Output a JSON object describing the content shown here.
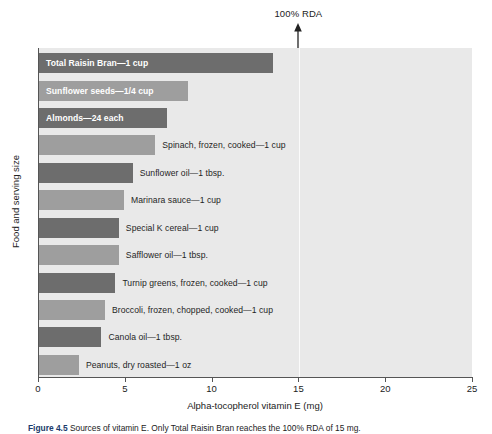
{
  "figure": {
    "annotation": {
      "rda_label": "100% RDA",
      "rda_value": 15,
      "arrow_icon": "up-arrow-icon"
    },
    "caption_number": "Figure 4.5",
    "caption_body": "Sources of vitamin E. Only Total Raisin Bran reaches the 100% RDA of 15 mg."
  },
  "chart_data": {
    "type": "bar",
    "orientation": "horizontal",
    "title": "",
    "xlabel": "Alpha-tocopherol vitamin E (mg)",
    "ylabel": "Food and serving size",
    "xlim": [
      0,
      25
    ],
    "xticks": [
      0,
      5,
      10,
      15,
      20,
      25
    ],
    "xtick_labels": [
      "0",
      "5",
      "10",
      "15",
      "20",
      "25"
    ],
    "grid": false,
    "legend": "none",
    "annotations": [
      {
        "label": "100% RDA",
        "x": 15,
        "type": "vline-with-arrow"
      }
    ],
    "colors": {
      "bar_dark": "#6d6d6d",
      "bar_light": "#9e9e9e",
      "plot_background": "#e9e9e9",
      "axis": "#555555",
      "label_inside": "#ffffff",
      "label_outside": "#1f1f1f",
      "caption_accent": "#1a3a6b"
    },
    "categories": [
      "Total Raisin Bran—1 cup",
      "Sunflower seeds—1/4 cup",
      "Almonds—24 each",
      "Spinach, frozen, cooked—1 cup",
      "Sunflower oil—1 tbsp.",
      "Marinara sauce—1 cup",
      "Special K cereal—1 cup",
      "Safflower oil—1 tbsp.",
      "Turnip greens, frozen, cooked—1 cup",
      "Broccoli, frozen, chopped, cooked—1 cup",
      "Canola oil—1 tbsp.",
      "Peanuts, dry roasted—1 oz"
    ],
    "values": [
      13.5,
      8.6,
      7.4,
      6.7,
      5.4,
      4.9,
      4.6,
      4.6,
      4.4,
      3.8,
      3.6,
      2.3
    ],
    "bars": [
      {
        "label": "Total Raisin Bran—1 cup",
        "value": 13.5,
        "shade": "dark",
        "label_position": "inside"
      },
      {
        "label": "Sunflower seeds—1/4 cup",
        "value": 8.6,
        "shade": "light",
        "label_position": "inside"
      },
      {
        "label": "Almonds—24 each",
        "value": 7.4,
        "shade": "dark",
        "label_position": "inside"
      },
      {
        "label": "Spinach, frozen, cooked—1 cup",
        "value": 6.7,
        "shade": "light",
        "label_position": "outside"
      },
      {
        "label": "Sunflower oil—1 tbsp.",
        "value": 5.4,
        "shade": "dark",
        "label_position": "outside"
      },
      {
        "label": "Marinara sauce—1 cup",
        "value": 4.9,
        "shade": "light",
        "label_position": "outside"
      },
      {
        "label": "Special K cereal—1 cup",
        "value": 4.6,
        "shade": "dark",
        "label_position": "outside"
      },
      {
        "label": "Safflower oil—1 tbsp.",
        "value": 4.6,
        "shade": "light",
        "label_position": "outside"
      },
      {
        "label": "Turnip greens, frozen, cooked—1 cup",
        "value": 4.4,
        "shade": "dark",
        "label_position": "outside"
      },
      {
        "label": "Broccoli, frozen, chopped, cooked—1 cup",
        "value": 3.8,
        "shade": "light",
        "label_position": "outside"
      },
      {
        "label": "Canola oil—1 tbsp.",
        "value": 3.6,
        "shade": "dark",
        "label_position": "outside"
      },
      {
        "label": "Peanuts, dry roasted—1 oz",
        "value": 2.3,
        "shade": "light",
        "label_position": "outside"
      }
    ]
  }
}
